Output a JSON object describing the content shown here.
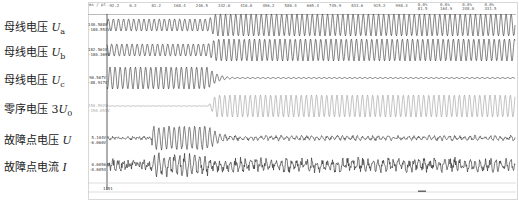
{
  "chart_data": {
    "type": "line",
    "title": "",
    "xlabel": "",
    "ylabel": "",
    "x_tick_labels": [
      "-92.2",
      "0.3",
      "81.2",
      "168.4",
      "246.5",
      "332.6",
      "416.0",
      "496.2",
      "580.4",
      "665.4",
      "749.9",
      "833.6",
      "915.2",
      "998.4",
      "0.0%/81.5",
      "0.0%/164.9",
      "0.0%/248.0",
      "0.0%/331.5"
    ],
    "corner_label": "ms / pt",
    "cursor_label": "1151",
    "series": [
      {
        "name": "母线电压 Ua",
        "max_label": "140.588V",
        "min_label": "-180.551V",
        "color": "#333333",
        "amp_pre": 0.55,
        "amp_post": 1.0,
        "event": "amplitude increases after fault clearing segment (~x=246)"
      },
      {
        "name": "母线电压 Ub",
        "max_label": "182.561V",
        "min_label": "-180.369V",
        "color": "#333333",
        "amp_pre": 0.55,
        "amp_post": 1.0,
        "event": "amplitude increases"
      },
      {
        "name": "母线电压 Uc",
        "max_label": "90.567V",
        "min_label": "-88.917V",
        "color": "#333333",
        "amp_pre": 1.0,
        "amp_post": 0.05,
        "event": "decays to near zero"
      },
      {
        "name": "零序电压 3U0",
        "max_label": "150.592V",
        "min_label": "-150.051V",
        "color": "#999999",
        "amp_pre": 0.0,
        "amp_post": 1.0,
        "event": "appears"
      },
      {
        "name": "故障点电压 U",
        "max_label": "5.104V",
        "min_label": "-6.060V",
        "color": "#333333",
        "amp_pre": 0.08,
        "amp_burst": 1.0,
        "amp_post": 0.15,
        "event": "burst then decays"
      },
      {
        "name": "故障点电流 I",
        "max_label": "0.0056",
        "min_label": "-0.0054",
        "color": "#333333",
        "amp_pre": 0.3,
        "amp_burst": 1.0,
        "amp_post": 0.45,
        "event": "noisy burst"
      }
    ]
  },
  "rows": [
    {
      "label_prefix": "母线电压 ",
      "symbol": "U",
      "sub": "a",
      "max": "140.588V",
      "min": "-180.551V"
    },
    {
      "label_prefix": "母线电压 ",
      "symbol": "U",
      "sub": "b",
      "max": "182.561V",
      "min": "-180.369V"
    },
    {
      "label_prefix": "母线电压 ",
      "symbol": "U",
      "sub": "c",
      "max": "90.567V",
      "min": "-88.917V"
    },
    {
      "label_prefix": "零序电压 3",
      "symbol": "U",
      "sub": "0",
      "max": "150.592V",
      "min": "-150.051V"
    },
    {
      "label_prefix": "故障点电压 ",
      "symbol": "U",
      "sub": "",
      "max": "5.104V",
      "min": "-6.060V"
    },
    {
      "label_prefix": "故障点电流 ",
      "symbol": "I",
      "sub": "",
      "max": "0.0056",
      "min": "-0.0054"
    }
  ]
}
